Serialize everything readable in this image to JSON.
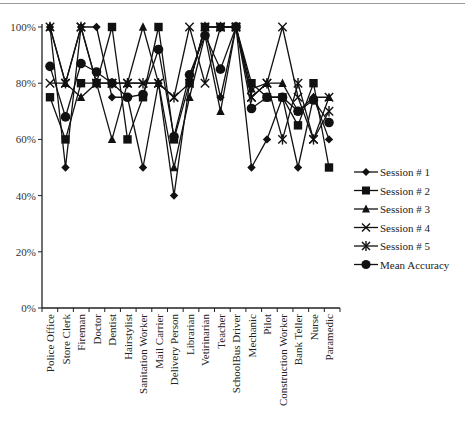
{
  "chart_data": {
    "type": "line",
    "title": "",
    "xlabel": "",
    "ylabel": "",
    "ylim": [
      0,
      100
    ],
    "yticks": [
      "0%",
      "20%",
      "40%",
      "60%",
      "80%",
      "100%"
    ],
    "grid": false,
    "legend_position": "right",
    "categories": [
      "Police Office",
      "Store Clerk",
      "Fireman",
      "Doctor",
      "Dentist",
      "Hairstylist",
      "Sanitation Worker",
      "Mail Carrier",
      "Delivery Person",
      "Librarian",
      "Vetirinarian",
      "Teacher",
      "SchoolBus Driver",
      "Mechanic",
      "Pilot",
      "Construction Worker",
      "Bank Teller",
      "Nurse",
      "Paramedic"
    ],
    "series": [
      {
        "name": "Session # 1",
        "marker": "diamond",
        "values": [
          100,
          50,
          100,
          100,
          75,
          75,
          50,
          80,
          40,
          80,
          100,
          75,
          100,
          50,
          60,
          75,
          50,
          75,
          60
        ]
      },
      {
        "name": "Session # 2",
        "marker": "square",
        "values": [
          75,
          60,
          80,
          80,
          100,
          60,
          75,
          100,
          60,
          80,
          100,
          100,
          100,
          80,
          75,
          75,
          65,
          80,
          50
        ]
      },
      {
        "name": "Session # 3",
        "marker": "triangle",
        "values": [
          100,
          80,
          75,
          80,
          60,
          80,
          100,
          80,
          50,
          75,
          97,
          70,
          100,
          78,
          80,
          80,
          70,
          75,
          75
        ]
      },
      {
        "name": "Session # 4",
        "marker": "x",
        "values": [
          80,
          80,
          100,
          80,
          80,
          80,
          80,
          80,
          75,
          100,
          80,
          100,
          100,
          75,
          80,
          100,
          75,
          60,
          75
        ]
      },
      {
        "name": "Session # 5",
        "marker": "asterisk",
        "values": [
          100,
          80,
          100,
          80,
          80,
          80,
          80,
          80,
          75,
          80,
          100,
          100,
          100,
          75,
          80,
          60,
          80,
          60,
          70
        ]
      },
      {
        "name": "Mean Accuracy",
        "marker": "circle",
        "values": [
          86,
          68,
          87,
          84,
          80,
          75,
          76,
          92,
          61,
          83,
          97,
          85,
          100,
          71,
          75,
          75,
          70,
          74,
          66
        ]
      }
    ]
  }
}
